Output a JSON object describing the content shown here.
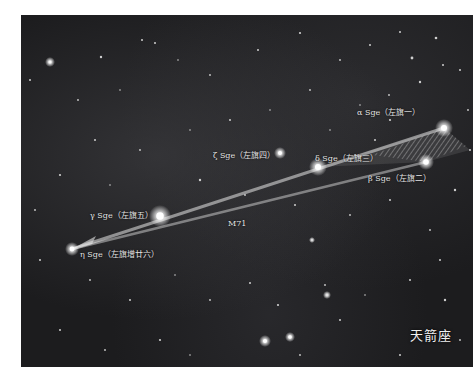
{
  "image": {
    "subject": "Sagitta constellation star field",
    "constellation_name": "天箭座",
    "stars": [
      {
        "id": "alpha",
        "label": "α Sge（左旗一）",
        "x": 444,
        "y": 128
      },
      {
        "id": "beta",
        "label": "β Sge（左旗二）",
        "x": 426,
        "y": 162
      },
      {
        "id": "delta",
        "label": "δ Sge（左旗三）",
        "x": 318,
        "y": 167
      },
      {
        "id": "zeta",
        "label": "ζ Sge（左旗四）",
        "x": 280,
        "y": 153
      },
      {
        "id": "gamma",
        "label": "γ Sge（左旗五）",
        "x": 160,
        "y": 216
      },
      {
        "id": "eta",
        "label": "η Sge（左旗增廿六）",
        "x": 72,
        "y": 249
      }
    ],
    "objects": [
      {
        "id": "m71",
        "label": "M71"
      }
    ],
    "colors": {
      "background": "#1c1c1e",
      "border": "#ffffff",
      "label_text": "#e6e6e6",
      "arrow_overlay": "#d8d8d8"
    }
  }
}
